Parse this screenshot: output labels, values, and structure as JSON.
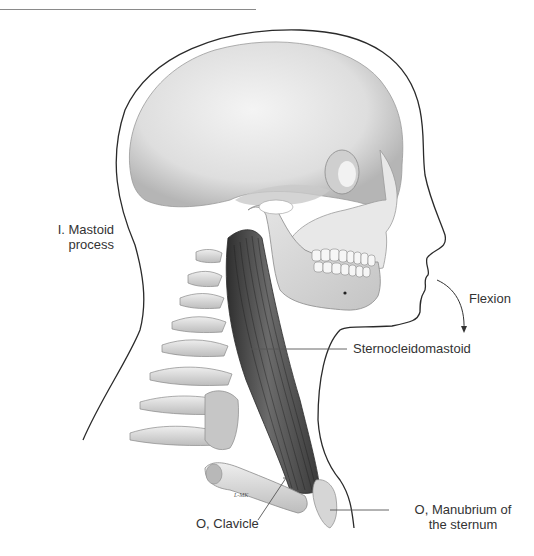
{
  "figure": {
    "labels": {
      "insertion": {
        "line1": "I. Mastoid",
        "line2": "process"
      },
      "action": "Flexion",
      "muscle": "Sternocleidomastoid",
      "origin_clavicle": "O, Clavicle",
      "origin_manubrium": {
        "line1": "O, Manubrium of",
        "line2": "the sternum"
      },
      "signature": "L-MK"
    },
    "colors": {
      "outline": "#2a2a2a",
      "bone_light": "#ececec",
      "bone_shadow": "#b9b9b9",
      "muscle_dark": "#3a3a3a",
      "muscle_mid": "#6a6a6a",
      "leader_line": "#555555",
      "text": "#333333"
    }
  }
}
